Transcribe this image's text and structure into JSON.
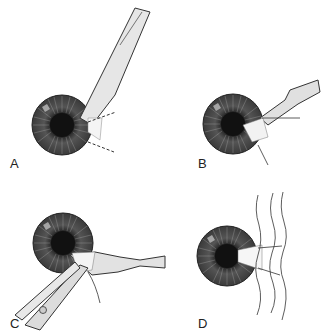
{
  "figure": {
    "panels": [
      {
        "label": "A",
        "description": "Iris with spatula/knife entering from upper right, dashed lines indicating incision region"
      },
      {
        "label": "B",
        "description": "Iris with spatula tip and fanned tissue at the right edge"
      },
      {
        "label": "C",
        "description": "Iris with spatula and forceps grasping tissue from lower left"
      },
      {
        "label": "D",
        "description": "Iris with excised wedge and wavy lines at right"
      }
    ]
  }
}
